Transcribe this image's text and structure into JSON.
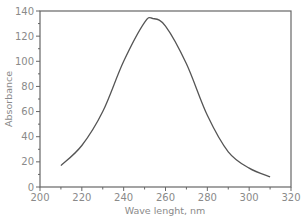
{
  "chart_data": {
    "type": "line",
    "title": "",
    "xlabel": "Wave lenght, nm",
    "ylabel": "Absorbance",
    "xlim": [
      200,
      320
    ],
    "ylim": [
      0,
      140
    ],
    "x_ticks": [
      200,
      220,
      240,
      260,
      280,
      300,
      320
    ],
    "y_ticks": [
      0,
      20,
      40,
      60,
      80,
      100,
      120,
      140
    ],
    "minor_ticks": true,
    "grid": false,
    "legend": null,
    "series": [
      {
        "name": "Absorbance",
        "color": "#555555",
        "x": [
          210,
          220,
          230,
          240,
          250,
          254,
          260,
          270,
          280,
          290,
          300,
          310
        ],
        "y": [
          17,
          33,
          60,
          100,
          131,
          134,
          128,
          98,
          57,
          28,
          15,
          8
        ]
      }
    ]
  },
  "style": {
    "axis_color": "#666666",
    "text_color": "#8a8a8a",
    "line_color": "#555555"
  }
}
